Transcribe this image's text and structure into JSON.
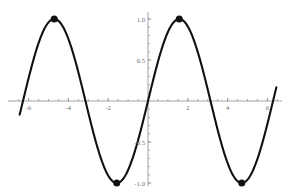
{
  "chart_data": {
    "type": "line",
    "title": "",
    "subtitle": "",
    "xlabel": "",
    "ylabel": "",
    "function": "y = sin(x)",
    "xlim": [
      -6.6,
      6.6
    ],
    "ylim": [
      -1.15,
      1.15
    ],
    "xticks": [
      -6,
      -4,
      -2,
      2,
      4,
      6
    ],
    "xtick_labels": [
      "-6",
      "-4",
      "-2",
      "2",
      "4",
      "6"
    ],
    "yticks": [
      -1.0,
      -0.5,
      0.5,
      1.0
    ],
    "ytick_labels": [
      "-1.0",
      "-0.5",
      "0.5",
      "1.0"
    ],
    "minor_tick_step_x": 0.5,
    "minor_tick_step_y": 0.1,
    "grid": false,
    "legend": null,
    "axes_style": "centered-crosshair",
    "line_color": "#111111",
    "line_width": 2.1,
    "marker_color": "#111111",
    "marker_size": 7,
    "axis_color": "#999999",
    "series": [
      {
        "name": "sin(x)",
        "x_start": -6.45,
        "x_end": 6.45,
        "samples": 400
      }
    ],
    "markers": [
      {
        "label": "maximum",
        "x": -4.712,
        "y": 1.0
      },
      {
        "label": "minimum",
        "x": -1.571,
        "y": -1.0
      },
      {
        "label": "maximum",
        "x": 1.571,
        "y": 1.0
      },
      {
        "label": "minimum",
        "x": 4.712,
        "y": -1.0
      }
    ]
  }
}
